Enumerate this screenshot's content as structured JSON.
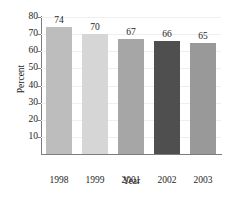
{
  "chart_data": {
    "type": "bar",
    "title": "",
    "xlabel": "Year",
    "ylabel": "Percent",
    "categories": [
      "1998",
      "1999",
      "2001",
      "2002",
      "2003"
    ],
    "values": [
      74,
      70,
      67,
      66,
      65
    ],
    "data_labels": [
      "74",
      "70",
      "67",
      "66",
      "65"
    ],
    "ylim": [
      0,
      80
    ],
    "yticks": [
      10,
      20,
      30,
      40,
      50,
      60,
      70,
      80
    ],
    "ytick_labels": [
      "10",
      "20",
      "30",
      "40",
      "50",
      "60",
      "70",
      "80"
    ],
    "grid": true,
    "legend": false,
    "bar_colors": [
      "#bdbdbd",
      "#d6d6d6",
      "#a6a6a6",
      "#4f4f4f",
      "#999999"
    ],
    "axis_color": "#7d7d7d",
    "grid_color": "#efefef",
    "text_color": "#1d1d1d",
    "background": "#ffffff"
  }
}
